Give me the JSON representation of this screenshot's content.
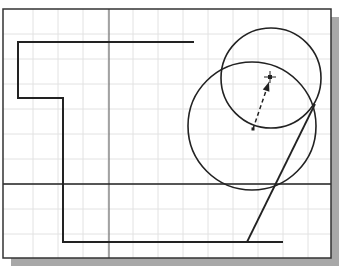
{
  "drawing": {
    "frame": {
      "x": 3,
      "y": 9,
      "width": 328,
      "height": 249
    },
    "shadow": {
      "offset": 8,
      "color": "#a8a8a8"
    },
    "colors": {
      "background": "#ffffff",
      "grid": "#e2e2e2",
      "axis": "#555555",
      "geometry": "#222222",
      "frame": "#333333"
    },
    "grid_spacing": 25,
    "grid_origin": {
      "x": 8,
      "y": 9
    },
    "axes": {
      "vertical_x": 109,
      "horizontal_y": 184
    },
    "polyline": [
      [
        194,
        42
      ],
      [
        18,
        42
      ],
      [
        18,
        98
      ],
      [
        63,
        98
      ],
      [
        63,
        242
      ],
      [
        283,
        242
      ]
    ],
    "circles": [
      {
        "name": "small-circle",
        "cx": 271,
        "cy": 78,
        "r": 50
      },
      {
        "name": "large-circle",
        "cx": 252,
        "cy": 126,
        "r": 64
      }
    ],
    "slanted_line": {
      "x1": 315,
      "y1": 104,
      "x2": 247,
      "y2": 242
    },
    "dashed_arrow": {
      "x1": 253,
      "y1": 129,
      "x2": 269,
      "y2": 82
    },
    "cursor_marker": {
      "x": 270,
      "y": 77
    }
  }
}
